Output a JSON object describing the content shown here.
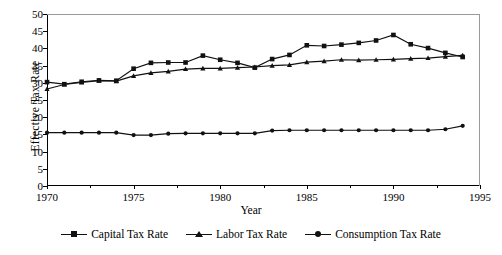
{
  "chart_data": {
    "type": "line",
    "title": "",
    "xlabel": "Year",
    "ylabel": "Effective Tax Rate",
    "xlim": [
      1970,
      1995
    ],
    "ylim": [
      0,
      50
    ],
    "xticks": [
      1970,
      1975,
      1980,
      1985,
      1990,
      1995
    ],
    "yticks": [
      0,
      5,
      10,
      15,
      20,
      25,
      30,
      35,
      40,
      45,
      50
    ],
    "xminor_step": 2.5,
    "grid": false,
    "legend_position": "bottom",
    "x": [
      1970,
      1971,
      1972,
      1973,
      1974,
      1975,
      1976,
      1977,
      1978,
      1979,
      1980,
      1981,
      1982,
      1983,
      1984,
      1985,
      1986,
      1987,
      1988,
      1989,
      1990,
      1991,
      1992,
      1993,
      1994
    ],
    "series": [
      {
        "name": "Capital Tax Rate",
        "marker": "square",
        "color": "#111111",
        "values": [
          30.2,
          29.6,
          30.3,
          30.7,
          30.6,
          34.1,
          35.8,
          35.9,
          35.9,
          37.9,
          36.7,
          35.8,
          34.4,
          36.9,
          38.1,
          40.9,
          40.7,
          41.1,
          41.6,
          42.3,
          43.9,
          41.2,
          40.1,
          38.7,
          37.5
        ],
        "notes": "peaks at 43.9 in 1990-91"
      },
      {
        "name": "Labor Tax Rate",
        "marker": "triangle",
        "color": "#111111",
        "values": [
          28.2,
          29.5,
          30.1,
          30.6,
          30.5,
          32.0,
          32.9,
          33.3,
          34.0,
          34.2,
          34.2,
          34.4,
          34.6,
          35.0,
          35.2,
          36.0,
          36.3,
          36.7,
          36.6,
          36.7,
          36.8,
          37.0,
          37.2,
          37.6,
          38.0
        ]
      },
      {
        "name": "Consumption Tax Rate",
        "marker": "circle",
        "color": "#111111",
        "values": [
          15.5,
          15.5,
          15.5,
          15.5,
          15.5,
          14.8,
          14.8,
          15.2,
          15.3,
          15.3,
          15.3,
          15.3,
          15.3,
          16.1,
          16.2,
          16.2,
          16.2,
          16.2,
          16.2,
          16.2,
          16.2,
          16.2,
          16.2,
          16.5,
          17.5
        ]
      }
    ]
  },
  "legend": {
    "items": [
      {
        "label": "Capital Tax Rate",
        "marker": "square"
      },
      {
        "label": "Labor Tax Rate",
        "marker": "triangle"
      },
      {
        "label": "Consumption Tax Rate",
        "marker": "circle"
      }
    ]
  }
}
